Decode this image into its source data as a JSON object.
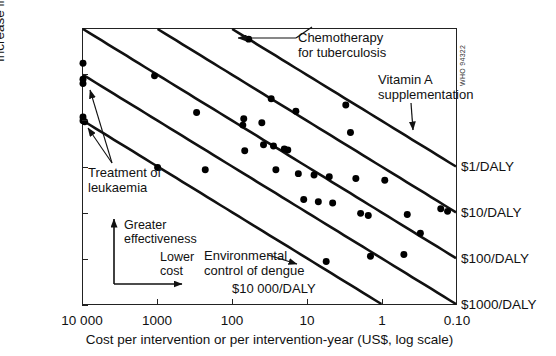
{
  "figure": {
    "who_code": "WHO 94322"
  },
  "axes": {
    "ylabel": "Increase in DALYs (log scale)",
    "xlabel": "Cost per intervention or per intervention-year (US$, log scale)",
    "yticks": [
      "100",
      "10",
      "1",
      "0.1",
      "0.01",
      "0.001",
      "0.0001"
    ],
    "ytick_values": [
      100,
      10,
      1,
      0.1,
      0.01,
      0.001,
      0.0001
    ],
    "xticks": [
      "10 000",
      "1000",
      "100",
      "10",
      "1",
      "0.10"
    ],
    "xtick_values": [
      10000,
      1000,
      100,
      10,
      1,
      0.1
    ]
  },
  "ratio_labels": [
    {
      "text": "$1/DALY",
      "y_value": 0.1
    },
    {
      "text": "$10/DALY",
      "y_value": 0.01
    },
    {
      "text": "$100/DALY",
      "y_value": 0.001
    },
    {
      "text": "$1000/DALY",
      "y_value": 0.0001
    }
  ],
  "inplot_labels": [
    {
      "text": "$10 000/DALY"
    }
  ],
  "annotations": [
    {
      "name": "chemotherapy-for-tuberculosis",
      "line1": "Chemotherapy",
      "line2": "for tuberculosis"
    },
    {
      "name": "vitamin-a-supplementation",
      "line1": "Vitamin A",
      "line2": "supplementation"
    },
    {
      "name": "treatment-of-leukaemia",
      "line1": "Treatment of",
      "line2": "leukaemia"
    },
    {
      "name": "environmental-control-of-dengue",
      "line1": "Environmental",
      "line2": "control of dengue"
    },
    {
      "name": "greater-effectiveness",
      "line1": "Greater",
      "line2": "effectiveness"
    },
    {
      "name": "lower-cost",
      "line1": "Lower",
      "line2": "cost"
    }
  ],
  "chart_data": {
    "type": "scatter",
    "title": "",
    "xlabel": "Cost per intervention or per intervention-year (US$, log scale)",
    "ylabel": "Increase in DALYs (log scale)",
    "xscale": "log",
    "yscale": "log",
    "x_reversed": true,
    "xlim": [
      10000,
      0.1
    ],
    "ylim": [
      0.0001,
      100
    ],
    "grid": false,
    "legend": "none",
    "xticks": [
      10000,
      1000,
      100,
      10,
      1,
      0.1
    ],
    "yticks": [
      100,
      10,
      1,
      0.1,
      0.01,
      0.001,
      0.0001
    ],
    "marker": "filled-circle",
    "marker_color": "#000000",
    "reference_lines": [
      {
        "label": "$1/DALY",
        "cost_per_daly": 1,
        "x_at_y_top": 10000,
        "note": "DALYs = cost / 1"
      },
      {
        "label": "$10/DALY",
        "cost_per_daly": 10,
        "note": "DALYs = cost / 10"
      },
      {
        "label": "$100/DALY",
        "cost_per_daly": 100,
        "note": "DALYs = cost / 100"
      },
      {
        "label": "$1000/DALY",
        "cost_per_daly": 1000,
        "note": "DALYs = cost / 1000"
      },
      {
        "label": "$10 000/DALY",
        "cost_per_daly": 10000,
        "note": "DALYs = cost / 10 000"
      }
    ],
    "points": [
      {
        "x": 10000,
        "y": 18
      },
      {
        "x": 10000,
        "y": 8.0
      },
      {
        "x": 10000,
        "y": 6.5
      },
      {
        "x": 10000,
        "y": 1.2
      },
      {
        "x": 10000,
        "y": 1.0
      },
      {
        "x": 9500,
        "y": 0.95
      },
      {
        "x": 1100,
        "y": 9.5
      },
      {
        "x": 1000,
        "y": 0.095
      },
      {
        "x": 300,
        "y": 1.5
      },
      {
        "x": 230,
        "y": 0.085
      },
      {
        "x": 60,
        "y": 60
      },
      {
        "x": 70,
        "y": 1.1
      },
      {
        "x": 72,
        "y": 0.8
      },
      {
        "x": 68,
        "y": 0.22
      },
      {
        "x": 40,
        "y": 0.9
      },
      {
        "x": 38,
        "y": 0.3
      },
      {
        "x": 30,
        "y": 3.0
      },
      {
        "x": 28,
        "y": 0.28
      },
      {
        "x": 26,
        "y": 0.085
      },
      {
        "x": 20,
        "y": 0.24
      },
      {
        "x": 18,
        "y": 0.23
      },
      {
        "x": 14,
        "y": 1.6
      },
      {
        "x": 13,
        "y": 0.07
      },
      {
        "x": 11,
        "y": 0.019
      },
      {
        "x": 8.0,
        "y": 0.065
      },
      {
        "x": 7.0,
        "y": 0.017
      },
      {
        "x": 5.0,
        "y": 0.06
      },
      {
        "x": 4.5,
        "y": 0.016
      },
      {
        "x": 3.0,
        "y": 2.2
      },
      {
        "x": 2.6,
        "y": 0.55
      },
      {
        "x": 2.2,
        "y": 0.055
      },
      {
        "x": 1.9,
        "y": 0.0095
      },
      {
        "x": 1.5,
        "y": 0.0085
      },
      {
        "x": 0.9,
        "y": 0.05
      },
      {
        "x": 0.45,
        "y": 0.009
      },
      {
        "x": 0.3,
        "y": 0.0035
      },
      {
        "x": 0.5,
        "y": 0.0012
      },
      {
        "x": 1.4,
        "y": 0.0011
      },
      {
        "x": 0.16,
        "y": 0.012
      },
      {
        "x": 0.13,
        "y": 0.0105
      },
      {
        "x": 5.5,
        "y": 0.00085
      }
    ]
  }
}
